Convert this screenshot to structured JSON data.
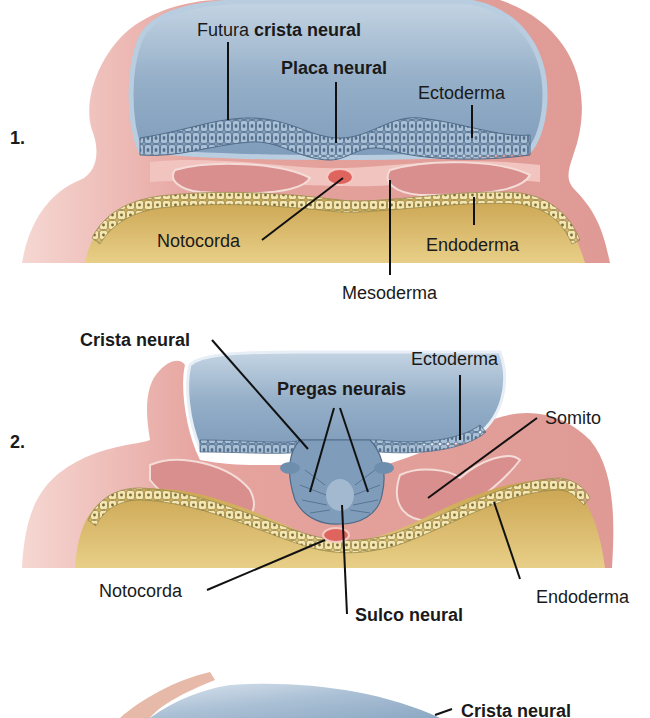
{
  "panels": [
    {
      "number": "1.",
      "labels": {
        "futura_prefix": "Futura ",
        "futura_bold": "crista neural",
        "placa_neural": "Placa neural",
        "ectoderma": "Ectoderma",
        "notocorda": "Notocorda",
        "endoderma": "Endoderma",
        "mesoderma": "Mesoderma"
      }
    },
    {
      "number": "2.",
      "labels": {
        "crista_neural": "Crista neural",
        "pregas_neurais": "Pregas neurais",
        "ectoderma": "Ectoderma",
        "somito": "Somito",
        "notocorda": "Notocorda",
        "endoderma": "Endoderma",
        "sulco_neural": "Sulco neural"
      }
    },
    {
      "number": "",
      "labels": {
        "crista_neural": "Crista neural"
      }
    }
  ],
  "colors": {
    "ectoderm_pink": "#e9a9a4",
    "ectoderm_pink_light": "#f3cfc9",
    "amnion_blue": "#8fa9c3",
    "amnion_blue_light": "#c9d7e4",
    "neural_cells": "#7f9cbb",
    "yolk": "#d8b868",
    "yolk_light": "#ecd592",
    "endoderm_cells": "#f0e1a6",
    "notochord": "#e0645e",
    "mesoderm": "#d98b8b"
  }
}
